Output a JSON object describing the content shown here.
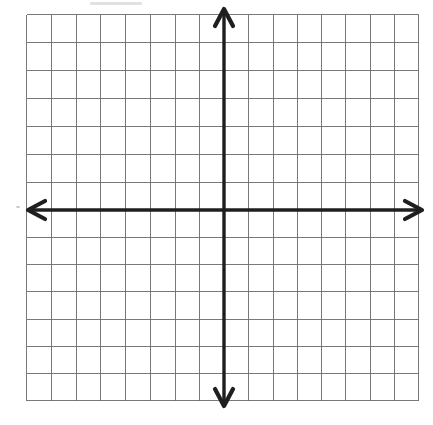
{
  "canvas": {
    "width": 433,
    "height": 425,
    "background": "#ffffff"
  },
  "grid": {
    "left": 26,
    "top": 14,
    "right": 418,
    "bottom": 400,
    "columns_left_of_axis": 8,
    "columns_right_of_axis": 8,
    "rows_above_axis": 7,
    "rows_below_axis": 7,
    "line_color": "#6b6b6b",
    "line_width": 1,
    "line_opacity": 0.9
  },
  "axes": {
    "origin_x": 224,
    "origin_y": 210,
    "color": "#1f1f1f",
    "shaft_width": 3.4,
    "x_axis": {
      "tip_left_x": 28,
      "tip_right_x": 422
    },
    "y_axis": {
      "tip_top_y": 9,
      "tip_bottom_y": 406
    },
    "arrowhead": {
      "depth": 17,
      "half_width": 9,
      "stroke_width": 4.2
    }
  },
  "artifacts": [
    {
      "shape": "smudge",
      "x": 90,
      "y": 2,
      "width": 52,
      "height": 3,
      "color": "#c8c8c8",
      "opacity": 0.55
    },
    {
      "shape": "speckle",
      "x": 16,
      "y": 206,
      "width": 4,
      "height": 2,
      "color": "#b5b5b5",
      "opacity": 0.7
    }
  ]
}
